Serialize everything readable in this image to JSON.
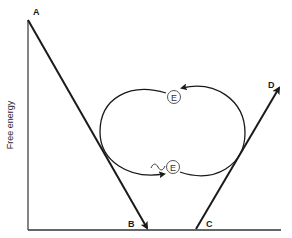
{
  "diagram": {
    "type": "free-energy-coupling",
    "y_axis_label": "Free energy",
    "points": {
      "A": "A",
      "B": "B",
      "C": "C",
      "D": "D"
    },
    "enzyme_labels": {
      "top": "E",
      "bottom": "E",
      "bottom_prefix": "~"
    },
    "colors": {
      "line": "#1a1a1a",
      "enzyme_circle": "#555555",
      "background": "#ffffff"
    }
  }
}
